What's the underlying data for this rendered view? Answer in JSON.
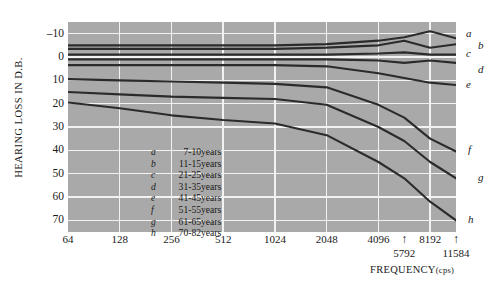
{
  "axes": {
    "ylabel": "HEARING LOSS IN D.B.",
    "xlabel": "FREQUENCY",
    "xlabel_unit": "(cps)",
    "yticks": [
      "–10",
      "0",
      "10",
      "20",
      "30",
      "40",
      "50",
      "60",
      "70"
    ],
    "xticks": [
      "64",
      "128",
      "256",
      "512",
      "1024",
      "2048",
      "4096",
      "8192"
    ],
    "xticks_secondary": [
      "5792",
      "11584"
    ]
  },
  "legend": {
    "rows": [
      {
        "key": "a",
        "range": "7-10",
        "unit": "years"
      },
      {
        "key": "b",
        "range": "11-15",
        "unit": "years"
      },
      {
        "key": "c",
        "range": "21-25",
        "unit": "years"
      },
      {
        "key": "d",
        "range": "31-35",
        "unit": "years"
      },
      {
        "key": "e",
        "range": "41-45",
        "unit": "years"
      },
      {
        "key": "f",
        "range": "51-55",
        "unit": "years"
      },
      {
        "key": "g",
        "range": "61-65",
        "unit": "years"
      },
      {
        "key": "h",
        "range": "70-82",
        "unit": "years"
      }
    ]
  },
  "endlabels": [
    "a",
    "b",
    "c",
    "d",
    "e",
    "f",
    "g",
    "h"
  ],
  "colors": {
    "plot_background": "#a9a9a9",
    "gridline": "#f2f2f2",
    "curve": "#2b2b2b",
    "page_background": "#ffffff",
    "text": "#1a1a1a"
  },
  "chart_data": {
    "type": "line",
    "title": "",
    "xlabel": "FREQUENCY (cps)",
    "ylabel": "HEARING LOSS IN D.B.",
    "x": [
      64,
      128,
      256,
      512,
      1024,
      2048,
      4096,
      5792,
      8192,
      11584
    ],
    "xscale": "log2",
    "ylim": [
      -15,
      75
    ],
    "yticks": [
      -10,
      0,
      10,
      20,
      30,
      40,
      50,
      60,
      70
    ],
    "y_inverted": true,
    "grid": true,
    "legend_position": "inside-lower-left",
    "series": [
      {
        "name": "a",
        "label": "7-10 years",
        "values": [
          -5.0,
          -5.0,
          -5.0,
          -5.0,
          -5.0,
          -5.5,
          -7.0,
          -8.5,
          -11.0,
          -8.0
        ]
      },
      {
        "name": "b",
        "label": "11-15 years",
        "values": [
          -3.5,
          -3.5,
          -3.5,
          -3.5,
          -3.5,
          -4.0,
          -5.0,
          -7.0,
          -4.0,
          -5.5
        ]
      },
      {
        "name": "c",
        "label": "21-25 years",
        "values": [
          -1.0,
          -1.0,
          -1.0,
          -1.0,
          -1.0,
          -1.0,
          -1.5,
          -2.0,
          -1.0,
          -1.0
        ]
      },
      {
        "name": "d",
        "label": "31-35 years",
        "values": [
          1.0,
          1.0,
          1.0,
          1.0,
          1.0,
          1.0,
          1.5,
          2.5,
          1.5,
          2.5
        ]
      },
      {
        "name": "e",
        "label": "41-45 years",
        "values": [
          3.5,
          3.5,
          3.5,
          3.5,
          3.5,
          4.0,
          7.0,
          9.0,
          11.0,
          12.0
        ]
      },
      {
        "name": "f",
        "label": "51-55 years",
        "values": [
          9.5,
          10.0,
          10.5,
          11.0,
          11.5,
          13.0,
          20.5,
          26.0,
          35.0,
          40.5
        ]
      },
      {
        "name": "g",
        "label": "61-65 years",
        "values": [
          15.0,
          16.0,
          17.0,
          17.5,
          18.0,
          20.5,
          30.0,
          36.0,
          45.0,
          52.0
        ]
      },
      {
        "name": "h",
        "label": "70-82 years",
        "values": [
          19.5,
          22.0,
          25.0,
          27.0,
          28.5,
          33.5,
          45.0,
          52.0,
          62.0,
          70.0
        ]
      }
    ]
  }
}
